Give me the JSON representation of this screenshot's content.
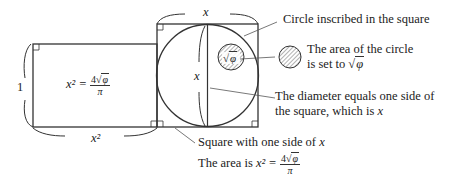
{
  "diagram": {
    "rectangle": {
      "height_label": "1",
      "width_label": "x²",
      "area_formula": {
        "lhs": "x² =",
        "numerator_coef": "4",
        "numerator_sqrt": "φ",
        "denominator": "π"
      }
    },
    "square": {
      "side_label_top": "x",
      "diameter_label": "x",
      "inner_circle_label": "φ"
    },
    "annotations": {
      "circle_inscribed": "Circle inscribed in the square",
      "area_line1": "The area of the circle",
      "area_line2": "is set to",
      "area_sqrt": "φ",
      "diameter_line1": "The diameter equals one side of",
      "diameter_line2": "the square,  which is",
      "diameter_var": "x",
      "square_line1": "Square with one side of",
      "square_var": "x",
      "square_area_prefix": "The area is",
      "square_area_lhs": "x² =",
      "square_area_coef": "4",
      "square_area_sqrt": "φ",
      "square_area_den": "π"
    },
    "colors": {
      "stroke": "#333333",
      "leader": "#555555",
      "hatch": "#666666"
    }
  }
}
